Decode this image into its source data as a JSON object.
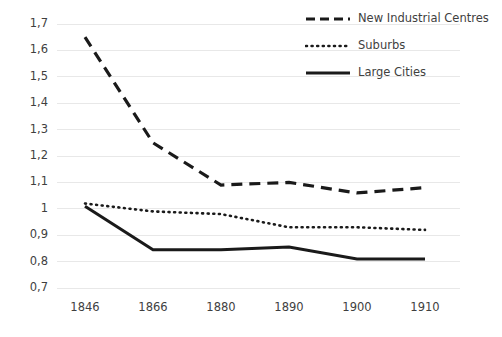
{
  "chart_data": {
    "type": "line",
    "title": "",
    "xlabel": "",
    "ylabel": "",
    "categories": [
      "1846",
      "1866",
      "1880",
      "1890",
      "1900",
      "1910"
    ],
    "ylim": [
      0.7,
      1.7
    ],
    "y_ticks": [
      0.7,
      0.8,
      0.9,
      1.0,
      1.1,
      1.2,
      1.3,
      1.4,
      1.5,
      1.6,
      1.7
    ],
    "y_tick_labels": [
      "0,7",
      "0,8",
      "0,9",
      "1",
      "1,1",
      "1,2",
      "1,3",
      "1,4",
      "1,5",
      "1,6",
      "1,7"
    ],
    "grid": "horizontal",
    "legend_position": "top-right-inside",
    "series": [
      {
        "name": "New Industrial Centres",
        "style": "dashed",
        "color": "#1a1a1a",
        "values": [
          1.65,
          1.25,
          1.09,
          1.1,
          1.06,
          1.08
        ]
      },
      {
        "name": "Suburbs",
        "style": "dotted",
        "color": "#1a1a1a",
        "values": [
          1.02,
          0.99,
          0.98,
          0.93,
          0.93,
          0.92
        ]
      },
      {
        "name": "Large Cities",
        "style": "solid",
        "color": "#1a1a1a",
        "values": [
          1.01,
          0.845,
          0.845,
          0.855,
          0.81,
          0.81
        ]
      }
    ]
  },
  "legend": {
    "items": [
      {
        "label": "New Industrial Centres",
        "sample": "dashed-line-sample"
      },
      {
        "label": "Suburbs",
        "sample": "dotted-line-sample"
      },
      {
        "label": "Large Cities",
        "sample": "solid-line-sample"
      }
    ]
  },
  "colors": {
    "line": "#1a1a1a",
    "grid": "#e8e8e8",
    "text": "#3f3f3f",
    "background": "#ffffff"
  }
}
